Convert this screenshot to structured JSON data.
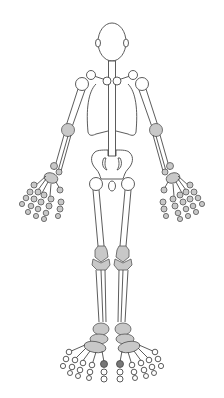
{
  "diagram": {
    "view": "front",
    "colors": {
      "background": "#ffffff",
      "outline": "#4a4a4a",
      "joint_fill": "#c8c8c8",
      "highlight_joint_fill": "#777777",
      "bone_fill": "#ffffff"
    },
    "parts": [
      "head",
      "neck",
      "shoulders",
      "clavicles",
      "ribcage",
      "spine",
      "upper-arms",
      "elbows",
      "forearms",
      "wrists",
      "hands",
      "pelvis",
      "hips",
      "femurs",
      "knees",
      "shins",
      "ankles",
      "feet"
    ],
    "highlighted_joints": [
      "left-big-toe",
      "right-big-toe"
    ]
  }
}
